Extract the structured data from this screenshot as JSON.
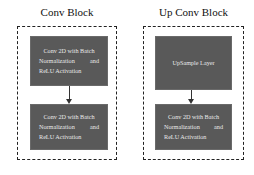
{
  "diagram": {
    "conv_block": {
      "title": "Conv Block",
      "boxes": [
        {
          "line1": "Conv 2D with Batch",
          "line2a": "Normalization",
          "line2b": "and",
          "line3": "ReLU Activation"
        },
        {
          "line1": "Conv 2D with Batch",
          "line2a": "Normalization",
          "line2b": "and",
          "line3": "ReLU Activation"
        }
      ]
    },
    "up_conv_block": {
      "title": "Up Conv Block",
      "boxes": [
        {
          "label": "UpSample Layer"
        },
        {
          "line1": "Conv 2D with Batch",
          "line2a": "Normalization",
          "line2b": "and",
          "line3": "ReLU Activation"
        }
      ]
    },
    "colors": {
      "box_fill": "#595959",
      "box_text": "#eaeaea",
      "border": "#222222"
    }
  }
}
